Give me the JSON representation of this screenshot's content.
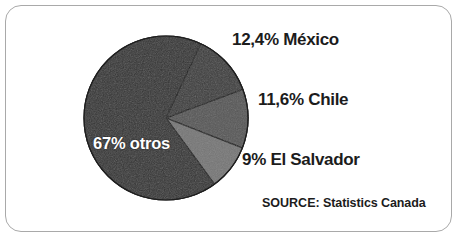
{
  "figure": {
    "source_prefix": "SOURCE:",
    "source_name": "Statistics Canada",
    "frame_color": "#a9a9a9",
    "background_color": "#ffffff"
  },
  "chart_data": {
    "type": "pie",
    "title": "",
    "subtitle": "",
    "xlabel": "",
    "ylabel": "",
    "grid": false,
    "legend_position": "none",
    "label_format": "inline-callout",
    "decimal_separator": ",",
    "units": "percent",
    "total": 100,
    "start_angle_deg": 25,
    "direction": "clockwise",
    "categories": [
      "México",
      "Chile",
      "El Salvador",
      "otros"
    ],
    "values": [
      12.4,
      11.6,
      9,
      67
    ],
    "slice_angles_deg": [
      44.6,
      41.8,
      32.4,
      241.2
    ],
    "colors": [
      "#3c3c3c",
      "#565656",
      "#767676",
      "#333333"
    ],
    "slices": [
      {
        "name": "México",
        "value": 12.4,
        "display_value": "12,4%",
        "label": "12,4% México",
        "color": "#3c3c3c",
        "label_placement": "outside-right",
        "label_color": "#1c1c1c"
      },
      {
        "name": "Chile",
        "value": 11.6,
        "display_value": "11,6%",
        "label": "11,6% Chile",
        "color": "#565656",
        "label_placement": "outside-right",
        "label_color": "#1c1c1c"
      },
      {
        "name": "El Salvador",
        "value": 9,
        "display_value": "9%",
        "label": "9% El Salvador",
        "color": "#767676",
        "label_placement": "outside-right",
        "label_color": "#1c1c1c"
      },
      {
        "name": "otros",
        "value": 67,
        "display_value": "67%",
        "label": "67% otros",
        "color": "#333333",
        "label_placement": "inside",
        "label_color": "#ffffff"
      }
    ]
  }
}
